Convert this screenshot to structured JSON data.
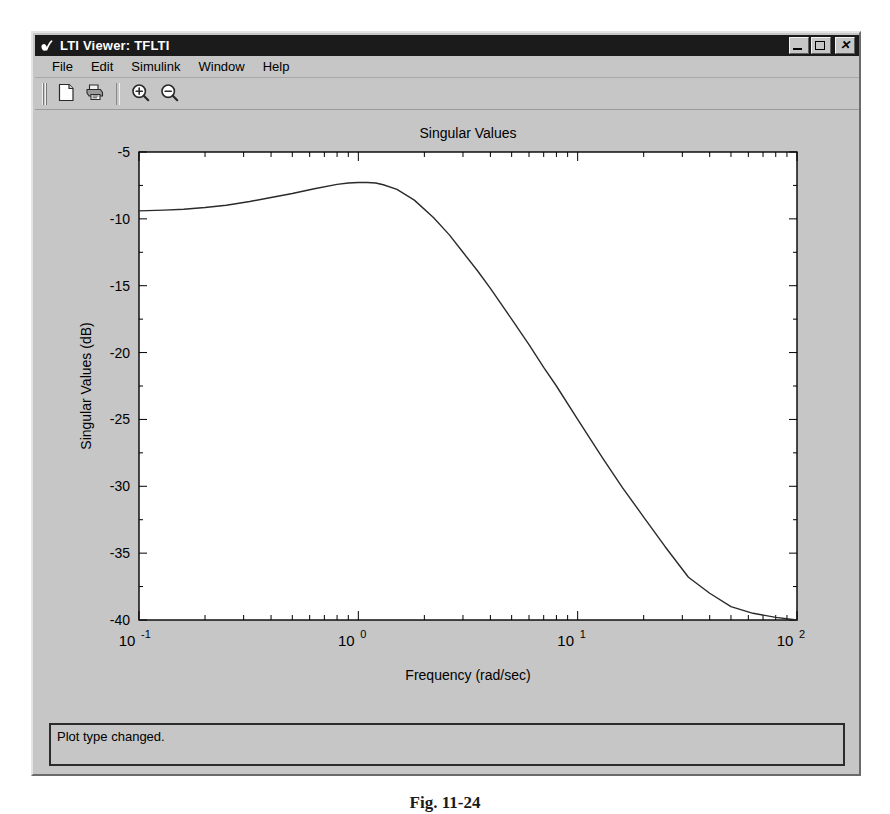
{
  "window": {
    "title": "LTI Viewer: TFLTI",
    "title_icon": "matlab-membrane-icon",
    "buttons": {
      "minimize": "minimize-icon",
      "maximize": "maximize-icon",
      "close": "✕"
    }
  },
  "menu": {
    "items": [
      {
        "label": "File"
      },
      {
        "label": "Edit"
      },
      {
        "label": "Simulink"
      },
      {
        "label": "Window"
      },
      {
        "label": "Help"
      }
    ]
  },
  "toolbar": {
    "items": [
      {
        "name": "new-document-icon",
        "tip": "New"
      },
      {
        "name": "print-icon",
        "tip": "Print"
      },
      {
        "name": "zoom-in-icon",
        "tip": "Zoom In"
      },
      {
        "name": "zoom-out-icon",
        "tip": "Zoom Out"
      }
    ]
  },
  "status": {
    "message": "Plot type changed."
  },
  "figure_caption": "Fig. 11-24",
  "colors": {
    "window_face": "#c6c6c6",
    "titlebar": "#1b1b1b",
    "plot_bg": "#ffffff",
    "curve": "#2a2a2a",
    "axis": "#000000",
    "text": "#000000"
  },
  "chart_data": {
    "type": "line",
    "title": "Singular Values",
    "xlabel": "Frequency (rad/sec)",
    "ylabel": "Singular Values (dB)",
    "xscale": "log",
    "xlim": [
      0.1,
      100
    ],
    "ylim": [
      -40,
      -5
    ],
    "yticks": [
      -5,
      -10,
      -15,
      -20,
      -25,
      -30,
      -35,
      -40
    ],
    "ytick_labels": [
      "-5",
      "-10",
      "-15",
      "-20",
      "-25",
      "-30",
      "-35",
      "-40"
    ],
    "xticks": [
      0.1,
      1,
      10,
      100
    ],
    "xtick_labels": [
      "10^-1",
      "10^0",
      "10^1",
      "10^2"
    ],
    "grid": false,
    "legend": null,
    "series": [
      {
        "name": "Singular Value",
        "x": [
          0.1,
          0.13,
          0.16,
          0.2,
          0.25,
          0.32,
          0.4,
          0.5,
          0.63,
          0.8,
          0.9,
          1.0,
          1.1,
          1.2,
          1.3,
          1.5,
          1.8,
          2.2,
          2.6,
          3.0,
          3.5,
          4.0,
          5.0,
          6.0,
          7.0,
          8.0,
          10.0,
          13.0,
          16.0,
          20.0,
          25.0,
          32.0,
          40.0,
          50.0,
          63.0,
          80.0,
          100.0
        ],
        "y": [
          -9.4,
          -9.35,
          -9.28,
          -9.15,
          -8.98,
          -8.7,
          -8.4,
          -8.1,
          -7.75,
          -7.42,
          -7.32,
          -7.28,
          -7.28,
          -7.32,
          -7.45,
          -7.8,
          -8.6,
          -9.9,
          -11.2,
          -12.5,
          -13.9,
          -15.2,
          -17.5,
          -19.4,
          -21.1,
          -22.5,
          -25.0,
          -27.9,
          -30.1,
          -32.3,
          -34.5,
          -36.8,
          -38.0,
          -39.0,
          -39.5,
          -39.8,
          -40.0
        ]
      }
    ]
  }
}
